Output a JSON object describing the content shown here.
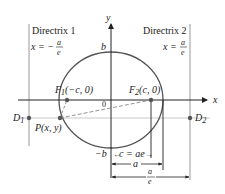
{
  "diagram": {
    "colors": {
      "curve": "#555555",
      "axis": "#222222",
      "directrix": "#999999",
      "point": "#555555",
      "dashed": "#888888",
      "background": "#ffffff"
    },
    "axes": {
      "x_label": "x",
      "y_label": "y",
      "origin_label": "0"
    },
    "directrix1": {
      "name": "Directrix 1",
      "equation_lhs": "x = −",
      "frac_num": "a",
      "frac_den": "e"
    },
    "directrix2": {
      "name": "Directrix 2",
      "equation_lhs": "x =",
      "frac_num": "a",
      "frac_den": "e"
    },
    "points": {
      "F1": {
        "label": "F",
        "sub": "1",
        "coords": "(−c, 0)"
      },
      "F2": {
        "label": "F",
        "sub": "2",
        "coords": "(c, 0)"
      },
      "P": {
        "label": "P(x, y)"
      },
      "D1": {
        "label": "D",
        "sub": "1"
      },
      "D2": {
        "label": "D",
        "sub": "2"
      }
    },
    "intercepts": {
      "b_top": "b",
      "b_bottom": "−b"
    },
    "dimensions": {
      "c": "c = ae",
      "a": "a",
      "a_over_e_num": "a",
      "a_over_e_den": "e"
    }
  }
}
